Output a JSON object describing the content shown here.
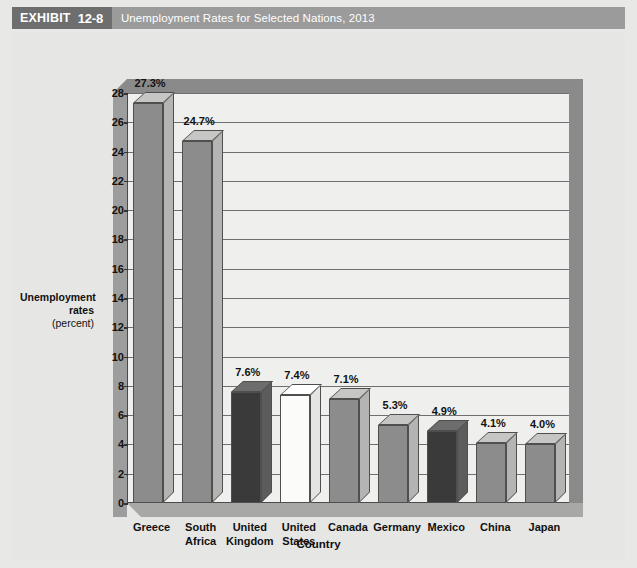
{
  "header": {
    "exhibit_word": "EXHIBIT",
    "exhibit_number": "12-8",
    "title": "Unemployment Rates for Selected Nations, 2013"
  },
  "colors": {
    "header_band": "#9b9b9b",
    "header_tag": "#6e6e6e",
    "plot_background": "#efefed",
    "figure_background": "#e6e6e4",
    "bar_default": "#8c8c8c",
    "bar_dark": "#3a3a3a",
    "bar_white": "#fbfbfa",
    "gridline": "#6f6f6f",
    "axis": "#4a4a4a"
  },
  "yaxis": {
    "title_line1": "Unemployment",
    "title_line2": "rates",
    "title_line3": "(percent)",
    "ticks": [
      "0",
      "2",
      "4",
      "6",
      "8",
      "10",
      "12",
      "14",
      "16",
      "18",
      "20",
      "22",
      "24",
      "26",
      "28"
    ]
  },
  "xaxis": {
    "title": "Country"
  },
  "chart_data": {
    "type": "bar",
    "title": "Unemployment Rates for Selected Nations, 2013",
    "xlabel": "Country",
    "ylabel": "Unemployment rates (percent)",
    "ylim": [
      0,
      28
    ],
    "ytick_step": 2,
    "grid": true,
    "legend": false,
    "style": "3d-column",
    "categories": [
      "Greece",
      "South Africa",
      "United Kingdom",
      "United States",
      "Canada",
      "Germany",
      "Mexico",
      "China",
      "Japan"
    ],
    "category_lines": [
      [
        "Greece"
      ],
      [
        "South",
        "Africa"
      ],
      [
        "United",
        "Kingdom"
      ],
      [
        "United",
        "States"
      ],
      [
        "Canada"
      ],
      [
        "Germany"
      ],
      [
        "Mexico"
      ],
      [
        "China"
      ],
      [
        "Japan"
      ]
    ],
    "values": [
      27.3,
      24.7,
      7.6,
      7.4,
      7.1,
      5.3,
      4.9,
      4.1,
      4.0
    ],
    "data_labels": [
      "27.3%",
      "24.7%",
      "7.6%",
      "7.4%",
      "7.1%",
      "5.3%",
      "4.9%",
      "4.1%",
      "4.0%"
    ],
    "bar_colors": [
      "#8c8c8c",
      "#8c8c8c",
      "#3a3a3a",
      "#fbfbfa",
      "#8c8c8c",
      "#8c8c8c",
      "#3a3a3a",
      "#8c8c8c",
      "#8c8c8c"
    ],
    "bar_top_colors": [
      "#c6c6c4",
      "#c6c6c4",
      "#6d6d6d",
      "#ffffff",
      "#c6c6c4",
      "#c6c6c4",
      "#6d6d6d",
      "#c6c6c4",
      "#c6c6c4"
    ],
    "bar_side_colors": [
      "#b4b4b2",
      "#b4b4b2",
      "#5c5c5c",
      "#e4e4e2",
      "#b4b4b2",
      "#b4b4b2",
      "#5c5c5c",
      "#b4b4b2",
      "#b4b4b2"
    ]
  }
}
